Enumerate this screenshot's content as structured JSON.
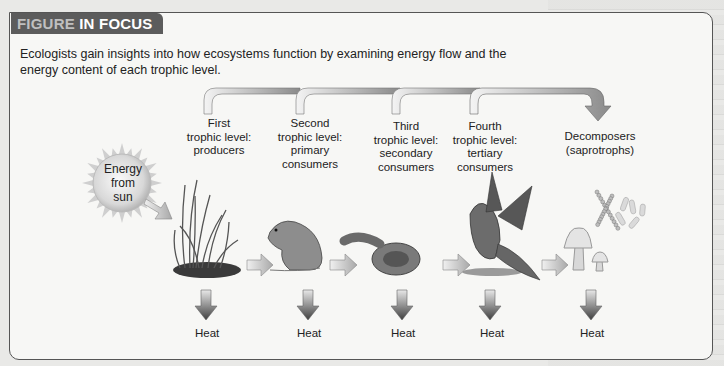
{
  "header": {
    "tab_light": "FIGURE",
    "tab_bold": "IN FOCUS"
  },
  "intro_text": "Ecologists gain insights into how ecosystems function by examining energy flow and the energy content of each trophic level.",
  "sun": {
    "line1": "Energy",
    "line2": "from",
    "line3": "sun"
  },
  "levels": [
    {
      "line1": "First",
      "line2": "trophic level:",
      "line3": "producers",
      "line4": "",
      "organism": "grass"
    },
    {
      "line1": "Second",
      "line2": "trophic level:",
      "line3": "primary",
      "line4": "consumers",
      "organism": "mouse"
    },
    {
      "line1": "Third",
      "line2": "trophic level:",
      "line3": "secondary",
      "line4": "consumers",
      "organism": "snake"
    },
    {
      "line1": "Fourth",
      "line2": "trophic level:",
      "line3": "tertiary",
      "line4": "consumers",
      "organism": "hawk"
    },
    {
      "line1": "Decomposers",
      "line2": "(saprotrophs)",
      "line3": "",
      "line4": "",
      "organism": "fungi-bacteria"
    }
  ],
  "heat_labels": [
    "Heat",
    "Heat",
    "Heat",
    "Heat",
    "Heat"
  ]
}
